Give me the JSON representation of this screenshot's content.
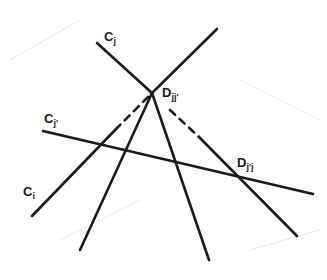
{
  "diagram": {
    "colors": {
      "ink": "#1a1a1a",
      "background": "#ffffff"
    },
    "labels": {
      "cj": {
        "main": "C",
        "sub": "j"
      },
      "dj": {
        "main": "D",
        "sub": "jj'"
      },
      "cjp": {
        "main": "C",
        "sub": "j'"
      },
      "djp": {
        "main": "D",
        "sub": "j'j"
      },
      "ci": {
        "main": "C",
        "sub": "i"
      }
    },
    "lines": [
      {
        "name": "line-cj",
        "segments": [
          {
            "style": "solid",
            "from": [
              97,
              43
            ],
            "to": [
              152,
              93
            ]
          },
          {
            "style": "dashed",
            "from": [
              170,
              110
            ],
            "to": [
              199,
              137
            ]
          },
          {
            "style": "solid",
            "from": [
              199,
              137
            ],
            "to": [
              297,
              236
            ]
          }
        ]
      },
      {
        "name": "line-ci",
        "segments": [
          {
            "style": "solid",
            "from": [
              217,
              29
            ],
            "to": [
              152,
              93
            ]
          },
          {
            "style": "dashed",
            "from": [
              148,
              97
            ],
            "to": [
              117,
              128
            ]
          },
          {
            "style": "solid",
            "from": [
              117,
              128
            ],
            "to": [
              32,
              216
            ]
          }
        ]
      },
      {
        "name": "line-left-ray",
        "segments": [
          {
            "style": "solid",
            "from": [
              152,
              93
            ],
            "to": [
              80,
              250
            ]
          }
        ]
      },
      {
        "name": "line-right-ray",
        "segments": [
          {
            "style": "solid",
            "from": [
              152,
              93
            ],
            "to": [
              209,
              260
            ]
          }
        ]
      },
      {
        "name": "line-cjp",
        "segments": [
          {
            "style": "solid",
            "from": [
              43,
              131
            ],
            "to": [
              313,
              194
            ]
          }
        ]
      }
    ]
  }
}
